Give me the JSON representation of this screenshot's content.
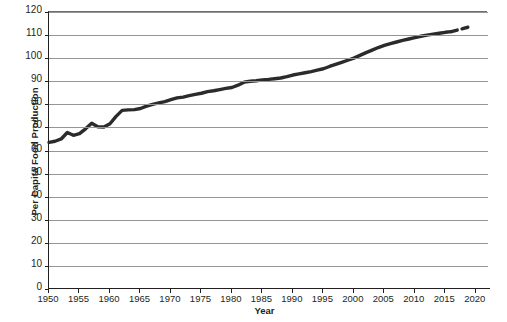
{
  "chart_data": {
    "type": "line",
    "title": "",
    "xlabel": "Year",
    "ylabel": "Per Capita Food Production",
    "xlim": [
      1950,
      2022
    ],
    "ylim": [
      0,
      120
    ],
    "xticks": [
      1950,
      1955,
      1960,
      1965,
      1970,
      1975,
      1980,
      1985,
      1990,
      1995,
      2000,
      2005,
      2010,
      2015,
      2020
    ],
    "yticks": [
      0,
      10,
      20,
      30,
      40,
      50,
      60,
      70,
      80,
      90,
      100,
      110,
      120
    ],
    "grid": "horizontal",
    "legend": "none",
    "line_color": "#2b2b2b",
    "series": [
      {
        "name": "Per Capita Food Production",
        "style": "solid",
        "x": [
          1950,
          1951,
          1952,
          1953,
          1954,
          1955,
          1956,
          1957,
          1958,
          1959,
          1960,
          1961,
          1962,
          1963,
          1964,
          1965,
          1966,
          1967,
          1968,
          1969,
          1970,
          1971,
          1972,
          1973,
          1974,
          1975,
          1976,
          1977,
          1978,
          1979,
          1980,
          1981,
          1982,
          1983,
          1984,
          1985,
          1986,
          1987,
          1988,
          1989,
          1990,
          1991,
          1992,
          1993,
          1994,
          1995,
          1996,
          1997,
          1998,
          1999,
          2000,
          2001,
          2002,
          2003,
          2004,
          2005,
          2006,
          2007,
          2008,
          2009,
          2010,
          2011,
          2012,
          2013,
          2014,
          2015,
          2016
        ],
        "y": [
          63.5,
          64.0,
          65.0,
          67.8,
          66.6,
          67.3,
          69.4,
          71.8,
          70.3,
          70.2,
          71.6,
          74.8,
          77.4,
          77.6,
          77.7,
          78.2,
          79.2,
          80.0,
          80.6,
          81.2,
          82.0,
          82.8,
          83.1,
          83.8,
          84.3,
          84.8,
          85.5,
          85.9,
          86.4,
          86.9,
          87.3,
          88.3,
          89.6,
          90.0,
          90.2,
          90.6,
          90.8,
          91.1,
          91.4,
          92.0,
          92.7,
          93.2,
          93.7,
          94.2,
          94.8,
          95.4,
          96.4,
          97.3,
          98.2,
          99.1,
          100.0,
          101.2,
          102.4,
          103.5,
          104.6,
          105.5,
          106.3,
          107.0,
          107.7,
          108.3,
          108.9,
          109.5,
          110.0,
          110.4,
          110.8,
          111.2,
          111.5
        ]
      },
      {
        "name": "Projection",
        "style": "dashed",
        "x": [
          2016,
          2017,
          2018,
          2019
        ],
        "y": [
          111.5,
          112.2,
          112.9,
          113.6
        ]
      }
    ]
  },
  "axes": {
    "x_title": "Year",
    "y_title": "Per Capita Food Production"
  }
}
